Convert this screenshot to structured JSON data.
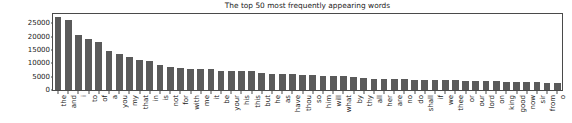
{
  "chart_data": {
    "type": "bar",
    "title": "The top 50 most frequently appearing words",
    "xlabel": "",
    "ylabel": "",
    "ylim": [
      0,
      28500
    ],
    "yticks": [
      0,
      5000,
      10000,
      15000,
      20000,
      25000
    ],
    "ytick_labels": [
      "0",
      "5000",
      "10000",
      "15000",
      "20000",
      "25000"
    ],
    "grid": false,
    "legend": false,
    "bar_color": "#5a5a5a",
    "categories": [
      "the",
      "and",
      "i",
      "to",
      "of",
      "a",
      "you",
      "my",
      "that",
      "in",
      "is",
      "not",
      "for",
      "with",
      "me",
      "it",
      "be",
      "your",
      "his",
      "this",
      "but",
      "he",
      "as",
      "have",
      "thou",
      "so",
      "him",
      "will",
      "what",
      "by",
      "thy",
      "all",
      "her",
      "are",
      "no",
      "do",
      "shall",
      "if",
      "we",
      "thee",
      "or",
      "our",
      "lord",
      "on",
      "king",
      "good",
      "now",
      "sir",
      "from",
      "o"
    ],
    "values": [
      27300,
      26400,
      20600,
      19200,
      18000,
      14600,
      13600,
      12300,
      11100,
      10800,
      9500,
      8600,
      8100,
      8000,
      8000,
      7800,
      7300,
      7000,
      7000,
      7000,
      6300,
      6100,
      6000,
      5900,
      5800,
      5700,
      5300,
      5200,
      5200,
      4700,
      4600,
      4200,
      4100,
      4000,
      4000,
      3900,
      3800,
      3800,
      3700,
      3600,
      3500,
      3400,
      3300,
      3300,
      3100,
      3000,
      3000,
      2900,
      2800,
      2700
    ]
  }
}
